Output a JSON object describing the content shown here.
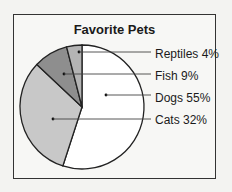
{
  "chart_data": {
    "type": "pie",
    "title": "Favorite Pets",
    "categories": [
      "Dogs",
      "Cats",
      "Fish",
      "Reptiles"
    ],
    "values": [
      55,
      32,
      9,
      4
    ],
    "unit": "%",
    "labels": [
      "Dogs 55%",
      "Cats 32%",
      "Fish 9%",
      "Reptiles 4%"
    ],
    "colors": {
      "Dogs": "#ffffff",
      "Cats": "#c8c8c8",
      "Fish": "#8e8e8e",
      "Reptiles": "#b4b4b4"
    },
    "legend_position": "right, leader lines"
  }
}
